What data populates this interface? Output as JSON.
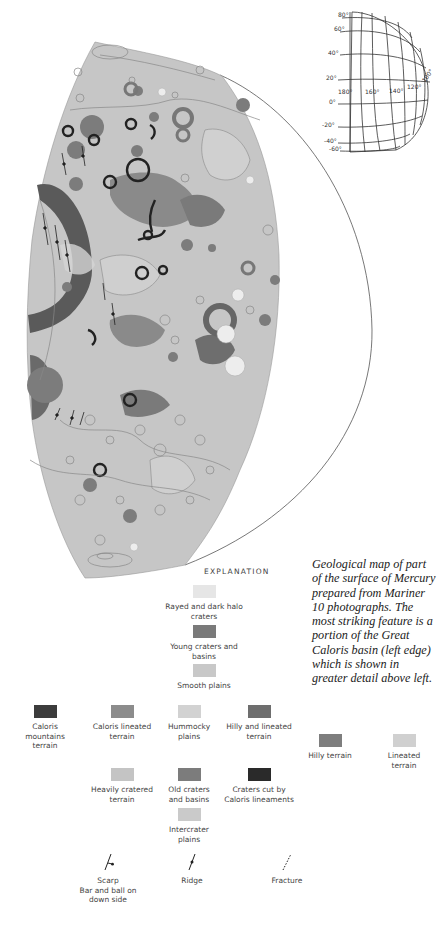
{
  "caption": "Geological map of part of the surface of Mercury prepared from Mariner 10 photographs. The most striking feature is a portion of the Great Caloris basin (left edge) which is shown in greater detail above left.",
  "locator_globe": {
    "latitude_labels": [
      "80°",
      "60°",
      "40°",
      "20°",
      "0°",
      "-20°",
      "-40°",
      "-60°"
    ],
    "longitude_labels": [
      "180°",
      "160°",
      "140°",
      "120°",
      "100°"
    ]
  },
  "legend": {
    "title": "EXPLANATION",
    "units": [
      {
        "label": "Rayed and dark halo craters",
        "color": "#e6e6e6"
      },
      {
        "label": "Young craters and basins",
        "color": "#7a7a7a"
      },
      {
        "label": "Smooth plains",
        "color": "#c8c8c8"
      },
      {
        "label": "Caloris mountains terrain",
        "color": "#3c3c3c"
      },
      {
        "label": "Caloris lineated terrain",
        "color": "#8c8c8c"
      },
      {
        "label": "Hummocky plains",
        "color": "#d2d2d2"
      },
      {
        "label": "Hilly and lineated terrain",
        "color": "#6e6e6e"
      },
      {
        "label": "Hilly terrain",
        "color": "#7e7e7e"
      },
      {
        "label": "Lineated terrain",
        "color": "#d0d0d0"
      },
      {
        "label": "Heavily cratered terrain",
        "color": "#c4c4c4"
      },
      {
        "label": "Old craters and basins",
        "color": "#7c7c7c"
      },
      {
        "label": "Craters cut by Caloris lineaments",
        "color": "#2a2a2a"
      },
      {
        "label": "Intercrater plains",
        "color": "#cacaca"
      }
    ],
    "symbols": [
      {
        "label": "Scarp",
        "sublabel": "Bar and ball on down side"
      },
      {
        "label": "Ridge"
      },
      {
        "label": "Fracture"
      }
    ]
  }
}
